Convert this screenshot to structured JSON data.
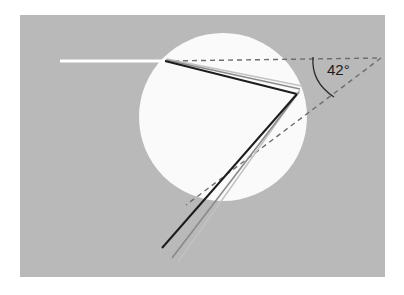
{
  "figure": {
    "canvas": {
      "width": 404,
      "height": 295,
      "background": "#ffffff"
    },
    "panel": {
      "x": 20,
      "y": 15,
      "width": 365,
      "height": 262,
      "fill": "#b9b9b9"
    },
    "droplet": {
      "cx": 223,
      "cy": 117,
      "r": 84,
      "fill": "#fafafa",
      "label": "water-droplet-circle"
    }
  },
  "annotations": {
    "angle_label": "42°",
    "angle_value": 42,
    "angle_unit": "degrees",
    "angle_label_x": 327,
    "angle_label_y": 62
  },
  "colors": {
    "panel_gray": "#b9b9b9",
    "droplet_white": "#fafafa",
    "incident_ray": "#ffffff",
    "ray_dark": "#1c1c1c",
    "ray_mid_gray": "#777777",
    "ray_light_gray": "#b0b0b0",
    "dashed_line": "#6e6e6e",
    "arc_line": "#2b2b2b",
    "text": "#1a1a1a"
  },
  "rays": {
    "incident": {
      "name": "incident-white-ray",
      "color": "#ffffff",
      "width": 3,
      "points": [
        [
          60,
          61
        ],
        [
          165,
          61
        ]
      ]
    },
    "internal_upper": [
      {
        "name": "internal-ray-dark",
        "color": "#1c1c1c",
        "width": 2.0,
        "points": [
          [
            165,
            61
          ],
          [
            297,
            94
          ]
        ]
      },
      {
        "name": "internal-ray-gray",
        "color": "#8a8a8a",
        "width": 1.6,
        "points": [
          [
            166,
            60
          ],
          [
            300,
            89
          ]
        ]
      },
      {
        "name": "internal-ray-light",
        "color": "#c2c2c2",
        "width": 1.4,
        "points": [
          [
            167,
            59
          ],
          [
            302,
            86
          ]
        ]
      }
    ],
    "exit_lower": [
      {
        "name": "exit-ray-dark",
        "color": "#1c1c1c",
        "width": 2.0,
        "points": [
          [
            297,
            94
          ],
          [
            162,
            248
          ]
        ]
      },
      {
        "name": "exit-ray-gray",
        "color": "#8a8a8a",
        "width": 1.6,
        "points": [
          [
            299,
            92
          ],
          [
            172,
            258
          ]
        ]
      },
      {
        "name": "exit-ray-light",
        "color": "#c2c2c2",
        "width": 1.4,
        "points": [
          [
            300,
            90
          ],
          [
            178,
            262
          ]
        ]
      }
    ]
  },
  "dashed": [
    {
      "name": "dashed-horizontal-axis",
      "points": [
        [
          165,
          61
        ],
        [
          381,
          58
        ]
      ],
      "color": "#6e6e6e",
      "width": 1.4,
      "dash": "5,4"
    },
    {
      "name": "dashed-deviation-line",
      "points": [
        [
          381,
          58
        ],
        [
          186,
          205
        ]
      ],
      "color": "#6e6e6e",
      "width": 1.4,
      "dash": "5,4"
    }
  ],
  "arc": {
    "name": "angle-arc",
    "color": "#2b2b2b",
    "width": 1.3,
    "path": "M 313 57 Q 311 82 334 97"
  }
}
